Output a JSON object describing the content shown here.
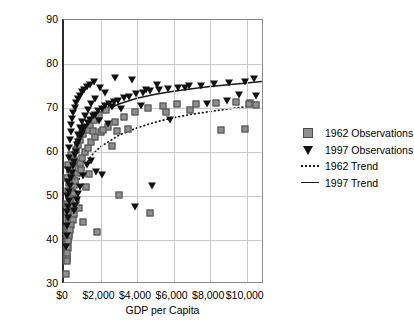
{
  "chart_data": {
    "type": "scatter",
    "title": "",
    "xlabel": "GDP per Capita",
    "ylabel": "Life Expectancy at Birth",
    "xlim": [
      0,
      11000
    ],
    "ylim": [
      30,
      90
    ],
    "grid": true,
    "legend_position": "right",
    "xticks": [
      "$0",
      "$2,000",
      "$4,000",
      "$6,000",
      "$8,000",
      "$10,000"
    ],
    "xtick_values": [
      0,
      2000,
      4000,
      6000,
      8000,
      10000
    ],
    "yticks": [
      "30",
      "40",
      "50",
      "60",
      "70",
      "80",
      "90"
    ],
    "ytick_values": [
      30,
      40,
      50,
      60,
      70,
      80,
      90
    ],
    "series": [
      {
        "name": "1962 Observations",
        "marker": "square",
        "color": "#8f8f8f",
        "points": [
          [
            120,
            32.3
          ],
          [
            150,
            35.8
          ],
          [
            170,
            36.2
          ],
          [
            190,
            38.5
          ],
          [
            155,
            39.3
          ],
          [
            205,
            40.1
          ],
          [
            230,
            40.6
          ],
          [
            185,
            41.2
          ],
          [
            250,
            41.5
          ],
          [
            300,
            42.0
          ],
          [
            165,
            42.4
          ],
          [
            215,
            43.0
          ],
          [
            280,
            43.6
          ],
          [
            330,
            44.2
          ],
          [
            195,
            44.8
          ],
          [
            260,
            45.3
          ],
          [
            360,
            45.9
          ],
          [
            225,
            46.4
          ],
          [
            400,
            47.0
          ],
          [
            310,
            47.6
          ],
          [
            175,
            48.2
          ],
          [
            430,
            48.8
          ],
          [
            345,
            49.4
          ],
          [
            270,
            50.1
          ],
          [
            500,
            50.6
          ],
          [
            210,
            51.2
          ],
          [
            380,
            51.8
          ],
          [
            560,
            52.4
          ],
          [
            290,
            53.0
          ],
          [
            620,
            53.5
          ],
          [
            140,
            54.1
          ],
          [
            460,
            54.6
          ],
          [
            700,
            55.2
          ],
          [
            340,
            55.8
          ],
          [
            780,
            56.4
          ],
          [
            240,
            57.0
          ],
          [
            900,
            57.5
          ],
          [
            520,
            58.1
          ],
          [
            1000,
            58.7
          ],
          [
            410,
            59.3
          ],
          [
            1150,
            59.9
          ],
          [
            640,
            60.4
          ],
          [
            1300,
            61.0
          ],
          [
            760,
            61.6
          ],
          [
            1500,
            62.2
          ],
          [
            880,
            62.8
          ],
          [
            1700,
            63.4
          ],
          [
            1050,
            64.0
          ],
          [
            2000,
            64.5
          ],
          [
            1250,
            65.1
          ],
          [
            2400,
            65.6
          ],
          [
            1450,
            66.2
          ],
          [
            2800,
            66.8
          ],
          [
            1650,
            67.3
          ],
          [
            3300,
            67.9
          ],
          [
            1900,
            68.4
          ],
          [
            3900,
            69.0
          ],
          [
            2300,
            69.5
          ],
          [
            4600,
            70.0
          ],
          [
            5400,
            70.4
          ],
          [
            6200,
            70.8
          ],
          [
            7200,
            71.0
          ],
          [
            8300,
            71.2
          ],
          [
            9400,
            71.3
          ],
          [
            10200,
            71.2
          ],
          [
            10500,
            70.6
          ],
          [
            2600,
            61.4
          ],
          [
            1800,
            41.8
          ],
          [
            3000,
            50.2
          ],
          [
            4700,
            46.2
          ],
          [
            1200,
            52.1
          ],
          [
            950,
            56.0
          ],
          [
            680,
            49.0
          ],
          [
            820,
            47.2
          ],
          [
            540,
            46.0
          ],
          [
            470,
            44.5
          ],
          [
            390,
            43.3
          ],
          [
            320,
            42.2
          ],
          [
            265,
            40.9
          ],
          [
            235,
            39.7
          ],
          [
            200,
            38.2
          ],
          [
            180,
            37.0
          ],
          [
            160,
            35.2
          ],
          [
            1050,
            44.1
          ],
          [
            5600,
            69.2
          ],
          [
            6900,
            69.6
          ],
          [
            8600,
            64.9
          ],
          [
            9900,
            65.3
          ],
          [
            10100,
            71.0
          ],
          [
            1350,
            54.9
          ],
          [
            1600,
            64.8
          ],
          [
            2150,
            64.9
          ],
          [
            2900,
            64.7
          ],
          [
            3500,
            65.2
          ]
        ]
      },
      {
        "name": "1997 Observations",
        "marker": "triangle-down",
        "color": "#111111",
        "points": [
          [
            130,
            38.5
          ],
          [
            160,
            41.0
          ],
          [
            185,
            43.2
          ],
          [
            210,
            45.0
          ],
          [
            145,
            46.3
          ],
          [
            240,
            47.5
          ],
          [
            270,
            48.8
          ],
          [
            175,
            50.0
          ],
          [
            300,
            51.0
          ],
          [
            340,
            52.2
          ],
          [
            195,
            53.2
          ],
          [
            380,
            54.2
          ],
          [
            420,
            55.2
          ],
          [
            225,
            56.0
          ],
          [
            470,
            56.9
          ],
          [
            520,
            57.8
          ],
          [
            255,
            58.6
          ],
          [
            580,
            59.4
          ],
          [
            640,
            60.1
          ],
          [
            285,
            60.8
          ],
          [
            710,
            61.5
          ],
          [
            790,
            62.2
          ],
          [
            320,
            62.8
          ],
          [
            870,
            63.4
          ],
          [
            960,
            64.0
          ],
          [
            360,
            64.6
          ],
          [
            1060,
            65.1
          ],
          [
            1170,
            65.7
          ],
          [
            400,
            66.2
          ],
          [
            1290,
            66.7
          ],
          [
            1420,
            67.2
          ],
          [
            450,
            67.6
          ],
          [
            1560,
            68.1
          ],
          [
            1710,
            68.5
          ],
          [
            510,
            68.9
          ],
          [
            1880,
            69.3
          ],
          [
            2060,
            69.7
          ],
          [
            580,
            70.1
          ],
          [
            2260,
            70.4
          ],
          [
            2480,
            70.8
          ],
          [
            660,
            71.1
          ],
          [
            2720,
            71.4
          ],
          [
            2980,
            71.7
          ],
          [
            750,
            72.0
          ],
          [
            3270,
            72.3
          ],
          [
            3580,
            72.6
          ],
          [
            850,
            72.8
          ],
          [
            3930,
            73.1
          ],
          [
            4310,
            73.3
          ],
          [
            970,
            73.6
          ],
          [
            4730,
            73.8
          ],
          [
            5190,
            74.0
          ],
          [
            1100,
            74.2
          ],
          [
            5690,
            74.4
          ],
          [
            6240,
            74.6
          ],
          [
            1250,
            74.8
          ],
          [
            6840,
            74.9
          ],
          [
            7500,
            75.1
          ],
          [
            1420,
            75.3
          ],
          [
            8230,
            75.4
          ],
          [
            9020,
            75.6
          ],
          [
            1620,
            75.8
          ],
          [
            9890,
            76.0
          ],
          [
            10400,
            76.5
          ],
          [
            10500,
            72.8
          ],
          [
            2800,
            76.8
          ],
          [
            3700,
            76.3
          ],
          [
            4500,
            74.1
          ],
          [
            5100,
            75.2
          ],
          [
            6600,
            74.5
          ],
          [
            7800,
            70.9
          ],
          [
            8900,
            71.6
          ],
          [
            9600,
            73.0
          ],
          [
            2400,
            66.3
          ],
          [
            1900,
            67.0
          ],
          [
            1500,
            58.0
          ],
          [
            1250,
            57.0
          ],
          [
            1050,
            54.5
          ],
          [
            900,
            52.0
          ],
          [
            780,
            50.5
          ],
          [
            690,
            49.2
          ],
          [
            600,
            47.8
          ],
          [
            530,
            46.5
          ],
          [
            2100,
            54.8
          ],
          [
            1750,
            55.5
          ],
          [
            4800,
            52.2
          ],
          [
            3900,
            47.5
          ],
          [
            5800,
            67.3
          ],
          [
            4200,
            70.5
          ],
          [
            3100,
            69.8
          ],
          [
            2650,
            70.2
          ],
          [
            2250,
            73.5
          ],
          [
            1950,
            74.5
          ],
          [
            1700,
            72.1
          ],
          [
            1480,
            71.0
          ],
          [
            1300,
            69.5
          ],
          [
            1150,
            68.2
          ],
          [
            990,
            66.8
          ],
          [
            860,
            65.4
          ],
          [
            740,
            63.9
          ]
        ]
      }
    ],
    "trends": [
      {
        "name": "1962 Trend",
        "style": "dotted",
        "color": "#1a1a1a",
        "model": "logarithmic",
        "points": [
          [
            100,
            36.0
          ],
          [
            300,
            45.5
          ],
          [
            600,
            51.5
          ],
          [
            1000,
            55.8
          ],
          [
            1500,
            59.2
          ],
          [
            2000,
            61.2
          ],
          [
            3000,
            63.8
          ],
          [
            4000,
            65.5
          ],
          [
            5000,
            66.8
          ],
          [
            6000,
            67.8
          ],
          [
            7000,
            68.6
          ],
          [
            8000,
            69.2
          ],
          [
            9000,
            69.8
          ],
          [
            10000,
            70.3
          ],
          [
            10800,
            70.6
          ]
        ]
      },
      {
        "name": "1997 Trend",
        "style": "solid",
        "color": "#1a1a1a",
        "model": "logarithmic",
        "points": [
          [
            100,
            45.0
          ],
          [
            200,
            52.0
          ],
          [
            400,
            58.5
          ],
          [
            700,
            62.8
          ],
          [
            1000,
            65.2
          ],
          [
            1500,
            67.5
          ],
          [
            2000,
            69.0
          ],
          [
            3000,
            70.9
          ],
          [
            4000,
            72.2
          ],
          [
            5000,
            73.1
          ],
          [
            6000,
            73.8
          ],
          [
            7000,
            74.4
          ],
          [
            8000,
            74.9
          ],
          [
            9000,
            75.3
          ],
          [
            10000,
            75.7
          ],
          [
            10800,
            76.0
          ]
        ]
      }
    ]
  },
  "legend": {
    "items": [
      {
        "label": "1962 Observations",
        "key": "square-marker"
      },
      {
        "label": "1997 Observations",
        "key": "triangle-marker"
      },
      {
        "label": "1962 Trend",
        "key": "dotted-line"
      },
      {
        "label": "1997 Trend",
        "key": "solid-line"
      }
    ]
  }
}
